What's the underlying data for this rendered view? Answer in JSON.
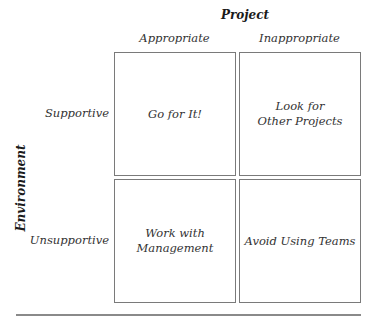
{
  "axes": {
    "column_title": "Project",
    "row_title": "Environment"
  },
  "columns": [
    {
      "label": "Appropriate"
    },
    {
      "label": "Inappropriate"
    }
  ],
  "rows": [
    {
      "label": "Supportive"
    },
    {
      "label": "Unsupportive"
    }
  ],
  "cells": [
    {
      "row": "Supportive",
      "column": "Appropriate",
      "text": "Go for It!"
    },
    {
      "row": "Supportive",
      "column": "Inappropriate",
      "text": "Look for\nOther Projects"
    },
    {
      "row": "Unsupportive",
      "column": "Appropriate",
      "text": "Work with\nManagement"
    },
    {
      "row": "Unsupportive",
      "column": "Inappropriate",
      "text": "Avoid Using Teams"
    }
  ],
  "colors": {
    "border": "#7a7a7a",
    "text": "#333333",
    "background": "#ffffff"
  }
}
